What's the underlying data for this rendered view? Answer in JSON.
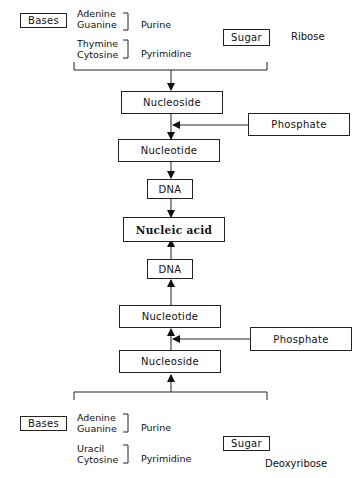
{
  "top_group": {
    "bases_label": "Bases",
    "purines": [
      "Adenine",
      "Guanine"
    ],
    "purine_label": "Purine",
    "pyrimidines": [
      "Thymine",
      "Cytosine"
    ],
    "pyrimidine_label": "Pyrimidine",
    "sugar_label": "Sugar",
    "sugar_value": "Ribose"
  },
  "upper_chain": {
    "nucleoside": "Nucleoside",
    "phosphate": "Phosphate",
    "nucleotide": "Nucleotide",
    "dna": "DNA"
  },
  "center": {
    "nucleic_acid": "Nucleic acid"
  },
  "lower_chain": {
    "dna": "DNA",
    "nucleotide": "Nucleotide",
    "phosphate": "Phosphate",
    "nucleoside": "Nucleoside"
  },
  "bottom_group": {
    "bases_label": "Bases",
    "purines": [
      "Adenine",
      "Guanine"
    ],
    "purine_label": "Purine",
    "pyrimidines": [
      "Uracil",
      "Cytosine"
    ],
    "pyrimidine_label": "Pyrimidine",
    "sugar_label": "Sugar",
    "sugar_value": "Deoxyribose"
  }
}
